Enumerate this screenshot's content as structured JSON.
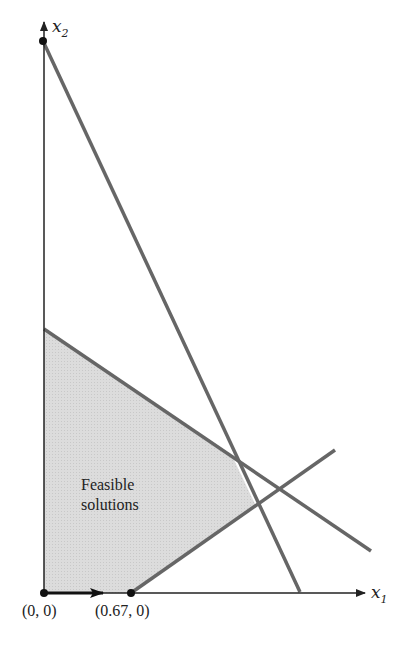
{
  "diagram": {
    "type": "linear-programming-feasible-region",
    "axes": {
      "x": {
        "label": "x",
        "subscript": "1"
      },
      "y": {
        "label": "x",
        "subscript": "2"
      }
    },
    "region": {
      "label_line1": "Feasible",
      "label_line2": "solutions",
      "fill": "#d9d9d9"
    },
    "points": [
      {
        "label": "(0, 0)"
      },
      {
        "label": "(0.67, 0)"
      }
    ],
    "colors": {
      "constraint_line": "#666666",
      "axis": "#222222"
    }
  }
}
